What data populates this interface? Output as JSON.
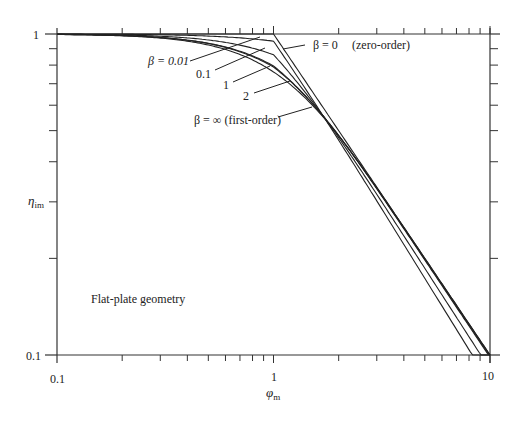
{
  "chart_data": {
    "type": "line",
    "title": "",
    "annotation": "Flat-plate geometry",
    "xlabel": "φ",
    "xlabel_sub": "m",
    "ylabel": "η",
    "ylabel_sub": "im",
    "xscale": "log",
    "yscale": "log",
    "xlim": [
      0.1,
      10
    ],
    "ylim": [
      0.1,
      1
    ],
    "x_tick_labels": [
      "0.1",
      "1",
      "10"
    ],
    "y_tick_labels": [
      "0.1",
      "1"
    ],
    "grid": false,
    "series": [
      {
        "name": "β = 0 (zero-order)",
        "label": "β = 0",
        "note": "(zero-order)",
        "beta": 0,
        "x": [
          0.1,
          0.5,
          1.0,
          2.0,
          3.0,
          5.0,
          10.0
        ],
        "values": [
          1.0,
          1.0,
          1.0,
          0.5,
          0.333,
          0.2,
          0.1
        ]
      },
      {
        "name": "β = 0.01",
        "label": "β = 0.01",
        "beta": 0.01,
        "x": [
          0.1,
          0.3,
          0.5,
          0.7,
          1.0,
          1.5,
          2.0,
          3.0,
          5.0,
          10.0
        ],
        "values": [
          1.0,
          0.99,
          0.97,
          0.93,
          0.85,
          0.62,
          0.49,
          0.333,
          0.2,
          0.1
        ]
      },
      {
        "name": "β = 0.1",
        "label": "0.1",
        "beta": 0.1,
        "x": [
          0.1,
          0.3,
          0.5,
          0.7,
          1.0,
          1.5,
          2.0,
          3.0,
          5.0,
          10.0
        ],
        "values": [
          1.0,
          0.985,
          0.95,
          0.9,
          0.81,
          0.62,
          0.48,
          0.33,
          0.2,
          0.1
        ]
      },
      {
        "name": "β = 1",
        "label": "1",
        "beta": 1,
        "x": [
          0.1,
          0.3,
          0.5,
          0.7,
          1.0,
          1.5,
          2.0,
          3.0,
          5.0,
          10.0
        ],
        "values": [
          0.997,
          0.975,
          0.93,
          0.87,
          0.78,
          0.6,
          0.47,
          0.33,
          0.2,
          0.1
        ]
      },
      {
        "name": "β = 2",
        "label": "2",
        "beta": 2,
        "x": [
          0.1,
          0.3,
          0.5,
          0.7,
          1.0,
          1.5,
          2.0,
          3.0,
          5.0,
          10.0
        ],
        "values": [
          0.996,
          0.973,
          0.925,
          0.865,
          0.77,
          0.6,
          0.47,
          0.33,
          0.2,
          0.1
        ]
      },
      {
        "name": "β = ∞ (first-order)",
        "label": "β = ∞",
        "note": "(first-order)",
        "beta": "inf",
        "x": [
          0.1,
          0.3,
          0.5,
          0.7,
          1.0,
          1.5,
          2.0,
          3.0,
          5.0,
          10.0
        ],
        "values": [
          0.997,
          0.971,
          0.924,
          0.861,
          0.762,
          0.603,
          0.482,
          0.332,
          0.2,
          0.1
        ]
      }
    ]
  },
  "labels": {
    "beta0": "β = 0",
    "beta0_note": "(zero-order)",
    "beta001": "β = 0.01",
    "beta01": "0.1",
    "beta1": "1",
    "beta2": "2",
    "betainf": "β = ∞ (first-order)",
    "geometry": "Flat-plate geometry",
    "x_tick_01": "0.1",
    "x_tick_1": "1",
    "x_tick_10": "10",
    "y_tick_1": "1",
    "y_tick_01": "0.1",
    "xlabel": "φ",
    "xlabel_sub": "m",
    "ylabel": "η",
    "ylabel_sub": "im"
  }
}
